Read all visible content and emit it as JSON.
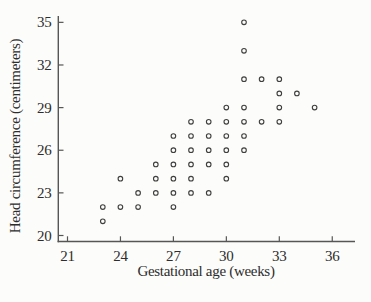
{
  "figure": {
    "background": "#fcfcfa",
    "axis_color": "#565656",
    "text_color": "#2d2d2d",
    "marker_color": "#3f3f3f"
  },
  "chart_data": {
    "type": "scatter",
    "title": "",
    "xlabel": "Gestational age (weeks)",
    "ylabel": "Head circumference (centimeters)",
    "x_ticks": [
      21,
      24,
      27,
      30,
      33,
      36
    ],
    "y_ticks": [
      20,
      23,
      26,
      29,
      32,
      35
    ],
    "xlim": [
      21,
      36
    ],
    "ylim": [
      20,
      35
    ],
    "grid": false,
    "legend": false,
    "marker": "open-circle",
    "points": [
      [
        23,
        21
      ],
      [
        23,
        22
      ],
      [
        24,
        22
      ],
      [
        25,
        22
      ],
      [
        27,
        22
      ],
      [
        25,
        23
      ],
      [
        26,
        23
      ],
      [
        27,
        23
      ],
      [
        28,
        23
      ],
      [
        29,
        23
      ],
      [
        24,
        24
      ],
      [
        26,
        24
      ],
      [
        27,
        24
      ],
      [
        28,
        24
      ],
      [
        30,
        24
      ],
      [
        26,
        25
      ],
      [
        27,
        25
      ],
      [
        28,
        25
      ],
      [
        29,
        25
      ],
      [
        30,
        25
      ],
      [
        27,
        26
      ],
      [
        28,
        26
      ],
      [
        29,
        26
      ],
      [
        30,
        26
      ],
      [
        31,
        26
      ],
      [
        27,
        27
      ],
      [
        28,
        27
      ],
      [
        29,
        27
      ],
      [
        30,
        27
      ],
      [
        31,
        27
      ],
      [
        28,
        28
      ],
      [
        29,
        28
      ],
      [
        30,
        28
      ],
      [
        31,
        28
      ],
      [
        32,
        28
      ],
      [
        33,
        28
      ],
      [
        30,
        29
      ],
      [
        31,
        29
      ],
      [
        33,
        29
      ],
      [
        35,
        29
      ],
      [
        33,
        30
      ],
      [
        34,
        30
      ],
      [
        31,
        31
      ],
      [
        32,
        31
      ],
      [
        33,
        31
      ],
      [
        31,
        33
      ],
      [
        31,
        35
      ]
    ]
  }
}
